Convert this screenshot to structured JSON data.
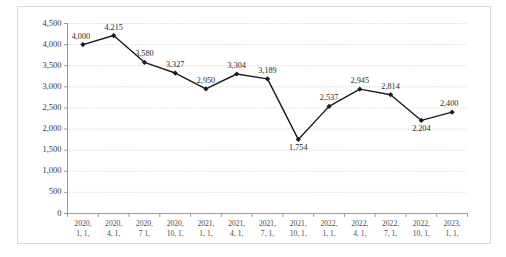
{
  "chart_data": {
    "type": "line",
    "title": "",
    "xlabel": "",
    "ylabel": "",
    "ylim": [
      0,
      4500
    ],
    "ytick_step": 500,
    "grid": true,
    "grid_style": "dotted",
    "legend": null,
    "marker": "diamond",
    "line_color": "#1a1a1a",
    "marker_color": "#1a1a1a",
    "grid_color": "#c8c8c8",
    "axis_color": "#9a9a9a",
    "categories": [
      "2020, 1, 1,",
      "2020, 4, 1,",
      "2020, 7 1,",
      "2020, 10, 1,",
      "2021, 1, 1,",
      "2021, 4, 1,",
      "2021, 7, 1,",
      "2021, 10, 1,",
      "2022, 1, 1,",
      "2022, 4, 1,",
      "2022, 7, 1,",
      "2022, 10, 1,",
      "2023, 1, 1,"
    ],
    "category_lines": [
      [
        "2020,",
        "1, 1,"
      ],
      [
        "2020,",
        "4, 1,"
      ],
      [
        "2020,",
        "7 1,"
      ],
      [
        "2020,",
        "10, 1,"
      ],
      [
        "2021,",
        "1, 1,"
      ],
      [
        "2021,",
        "4, 1,"
      ],
      [
        "2021,",
        "7, 1,"
      ],
      [
        "2021,",
        "10, 1,"
      ],
      [
        "2022,",
        "1, 1,"
      ],
      [
        "2022,",
        "4, 1,"
      ],
      [
        "2022,",
        "7, 1,"
      ],
      [
        "2022,",
        "10, 1,"
      ],
      [
        "2023,",
        "1, 1,"
      ]
    ],
    "values": [
      4000,
      4215,
      3580,
      3327,
      2950,
      3304,
      3189,
      1754,
      2537,
      2945,
      2814,
      2204,
      2400
    ],
    "value_labels": [
      "4,000",
      "4,215",
      "3,580",
      "3,327",
      "2,950",
      "3,304",
      "3,189",
      "1,754",
      "2,537",
      "2,945",
      "2,814",
      "2,204",
      "2,400"
    ],
    "ytick_values": [
      0,
      500,
      1000,
      1500,
      2000,
      2500,
      3000,
      3500,
      4000,
      4500
    ],
    "ytick_labels": [
      "0",
      "500",
      "1,000",
      "1,500",
      "2,000",
      "2,500",
      "3,000",
      "3,500",
      "4,000",
      "4,500"
    ]
  }
}
